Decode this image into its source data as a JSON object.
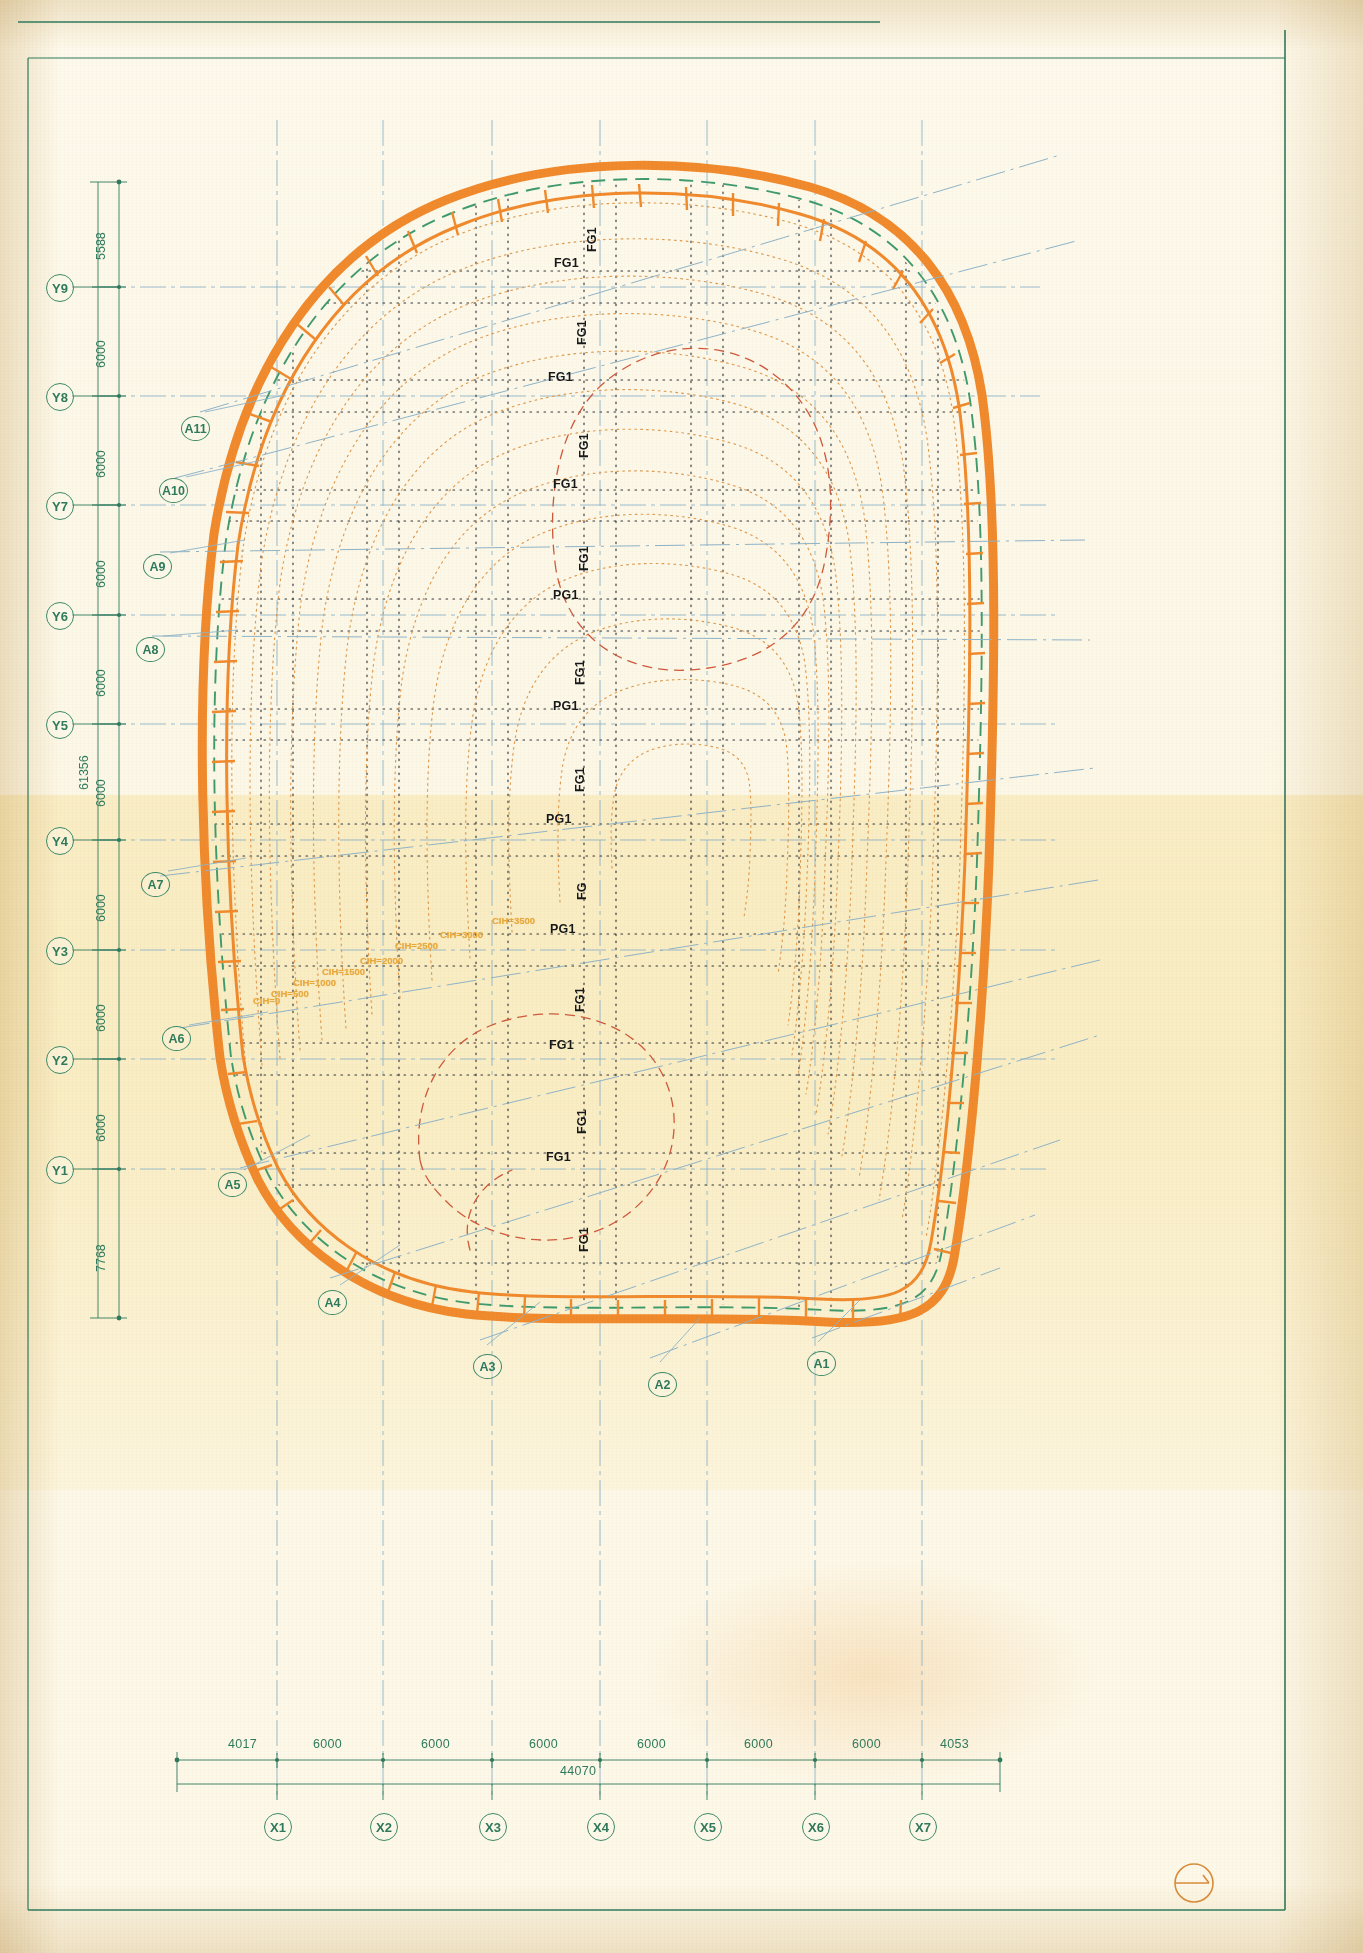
{
  "drawing": {
    "title": "Roof / Shell Structure Plan",
    "sheet_bg": "#fdf8ea",
    "colors": {
      "grid_green": "#2f7a5c",
      "grid_blue": "#7fa8bf",
      "shell_orange": "#f08a2c",
      "shell_green": "#3f9b6d",
      "contour_orange": "#e6a65a",
      "contour_red": "#cf5a3c",
      "label_black": "#17181a",
      "cih_yellow": "#e8a83c",
      "border_green": "#2f7a5c"
    }
  },
  "y_axis": {
    "bubbles": [
      {
        "id": "Y9",
        "y": 287
      },
      {
        "id": "Y8",
        "y": 396
      },
      {
        "id": "Y7",
        "y": 505
      },
      {
        "id": "Y6",
        "y": 615
      },
      {
        "id": "Y5",
        "y": 724
      },
      {
        "id": "Y4",
        "y": 840
      },
      {
        "id": "Y3",
        "y": 950
      },
      {
        "id": "Y2",
        "y": 1059
      },
      {
        "id": "Y1",
        "y": 1169
      }
    ],
    "dims": [
      "5588",
      "6000",
      "6000",
      "6000",
      "6000",
      "6000",
      "6000",
      "6000",
      "6000",
      "7768"
    ],
    "total": "61356"
  },
  "x_axis": {
    "bubbles": [
      {
        "id": "X1",
        "x": 277
      },
      {
        "id": "X2",
        "x": 383
      },
      {
        "id": "X3",
        "x": 492
      },
      {
        "id": "X4",
        "x": 600
      },
      {
        "id": "X5",
        "x": 707
      },
      {
        "id": "X6",
        "x": 815
      },
      {
        "id": "X7",
        "x": 922
      }
    ],
    "dims": [
      {
        "v": "4017",
        "x": 243
      },
      {
        "v": "6000",
        "x": 330
      },
      {
        "v": "6000",
        "x": 438
      },
      {
        "v": "6000",
        "x": 546
      },
      {
        "v": "6000",
        "x": 654
      },
      {
        "v": "6000",
        "x": 761
      },
      {
        "v": "6000",
        "x": 869
      },
      {
        "v": "4053",
        "x": 955
      }
    ],
    "total": "44070"
  },
  "section_markers": [
    {
      "id": "A11",
      "x": 181,
      "y": 416
    },
    {
      "id": "A10",
      "x": 159,
      "y": 478
    },
    {
      "id": "A9",
      "x": 143,
      "y": 554
    },
    {
      "id": "A8",
      "x": 136,
      "y": 637
    },
    {
      "id": "A7",
      "x": 141,
      "y": 872
    },
    {
      "id": "A6",
      "x": 162,
      "y": 1026
    },
    {
      "id": "A5",
      "x": 218,
      "y": 1172
    },
    {
      "id": "A4",
      "x": 318,
      "y": 1290
    },
    {
      "id": "A3",
      "x": 473,
      "y": 1354
    },
    {
      "id": "A2",
      "x": 648,
      "y": 1372
    },
    {
      "id": "A1",
      "x": 807,
      "y": 1351
    }
  ],
  "girder_labels": [
    {
      "t": "FG1",
      "x": 585,
      "y": 222,
      "rot": true
    },
    {
      "t": "FG1",
      "x": 554,
      "y": 256,
      "rot": false
    },
    {
      "t": "FG1",
      "x": 575,
      "y": 315,
      "rot": true
    },
    {
      "t": "FG1",
      "x": 548,
      "y": 370,
      "rot": false
    },
    {
      "t": "FG1",
      "x": 577,
      "y": 428,
      "rot": true
    },
    {
      "t": "FG1",
      "x": 553,
      "y": 477,
      "rot": false
    },
    {
      "t": "FG1",
      "x": 577,
      "y": 541,
      "rot": true
    },
    {
      "t": "PG1",
      "x": 553,
      "y": 588,
      "rot": false
    },
    {
      "t": "FG1",
      "x": 573,
      "y": 655,
      "rot": true
    },
    {
      "t": "PG1",
      "x": 553,
      "y": 699,
      "rot": false
    },
    {
      "t": "FG1",
      "x": 573,
      "y": 762,
      "rot": true
    },
    {
      "t": "PG1",
      "x": 546,
      "y": 812,
      "rot": false
    },
    {
      "t": "FG",
      "x": 575,
      "y": 874,
      "rot": true
    },
    {
      "t": "PG1",
      "x": 550,
      "y": 922,
      "rot": false
    },
    {
      "t": "FG1",
      "x": 573,
      "y": 982,
      "rot": true
    },
    {
      "t": "FG1",
      "x": 549,
      "y": 1038,
      "rot": false
    },
    {
      "t": "FG1",
      "x": 575,
      "y": 1104,
      "rot": true
    },
    {
      "t": "FG1",
      "x": 546,
      "y": 1150,
      "rot": false
    },
    {
      "t": "FG1",
      "x": 577,
      "y": 1222,
      "rot": true
    }
  ],
  "contour_labels": [
    {
      "t": "CIH=3500",
      "x": 492,
      "y": 915
    },
    {
      "t": "CIH=3000",
      "x": 440,
      "y": 929
    },
    {
      "t": "CIH=2500",
      "x": 395,
      "y": 940
    },
    {
      "t": "CIH=2000",
      "x": 360,
      "y": 955
    },
    {
      "t": "CIH=1500",
      "x": 322,
      "y": 966
    },
    {
      "t": "CIH=1000",
      "x": 293,
      "y": 977
    },
    {
      "t": "CIH=500",
      "x": 271,
      "y": 988
    },
    {
      "t": "CIH=0",
      "x": 253,
      "y": 995
    }
  ],
  "north_symbol": {
    "name": "north-arrow",
    "cx": 1194,
    "cy": 1883,
    "r": 19
  }
}
